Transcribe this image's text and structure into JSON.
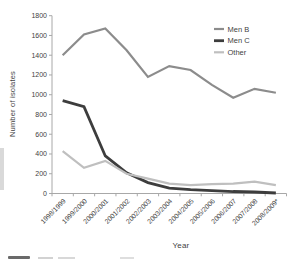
{
  "figure": {
    "y_axis_title": "Number of isolates",
    "x_axis_title": "Year"
  },
  "chart_data": {
    "type": "line",
    "title": "",
    "categories": [
      "1998/1999",
      "1999/2000",
      "2000/2001",
      "2001/2002",
      "2002/2003",
      "2003/2004",
      "2004/2005",
      "2005/2006",
      "2006/2007",
      "2007/2008",
      "2008/2009*"
    ],
    "series": [
      {
        "name": "Men B",
        "color": "#8c8c8c",
        "stroke_width": 2.2,
        "values": [
          1400,
          1610,
          1670,
          1450,
          1180,
          1290,
          1250,
          1100,
          970,
          1060,
          1020
        ]
      },
      {
        "name": "Men C",
        "color": "#3d3d3d",
        "stroke_width": 2.8,
        "values": [
          940,
          880,
          380,
          210,
          110,
          55,
          40,
          30,
          20,
          15,
          5
        ]
      },
      {
        "name": "Other",
        "color": "#bfbfbf",
        "stroke_width": 2.2,
        "values": [
          430,
          260,
          330,
          200,
          150,
          100,
          85,
          95,
          100,
          120,
          85
        ]
      }
    ],
    "xlabel": "Year",
    "ylabel": "Number of isolates",
    "ylim": [
      0,
      1800
    ],
    "ytick_step": 200,
    "yticks": [
      "0",
      "200",
      "400",
      "600",
      "800",
      "1000",
      "1200",
      "1400",
      "1600",
      "1800"
    ],
    "grid": false,
    "legend_position": "top-right",
    "axis_color": "#a8a8a8",
    "text_color": "#3f3f3f"
  }
}
